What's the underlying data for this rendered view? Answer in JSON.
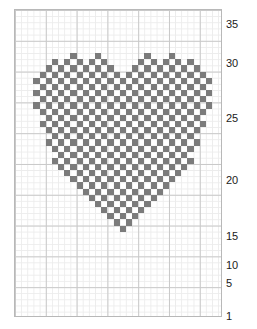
{
  "chart_data": {
    "type": "heatmap",
    "title": "",
    "subtitle": "",
    "xlabel": "",
    "ylabel": "",
    "grid": true,
    "legend_position": "none",
    "columns": 34,
    "rows": 50,
    "cell_size_px": 6.16,
    "major_gridline_every": 5,
    "axis_ranges": {
      "x": [
        1,
        34
      ],
      "y": [
        1,
        50
      ]
    },
    "colors": {
      "filled_cell": "#7b7b7b",
      "empty_cell": "#ffffff",
      "minor_gridline": "#ececec",
      "major_gridline": "#c9c9c9",
      "border": "#b8b8b8",
      "label_text": "#1a1a1a",
      "background": "#ffffff"
    },
    "y_tick_labels": [
      "35",
      "30",
      "25",
      "20",
      "15",
      "10",
      "5",
      "1"
    ],
    "y_tick_values": [
      35,
      30,
      25,
      20,
      15,
      10,
      5,
      1
    ],
    "y_tick_pixel_y": [
      24,
      63,
      118,
      180,
      236,
      265,
      283,
      316
    ],
    "pattern_note": "Row entries list the column indices (1-based, left to right) of filled squares for each chart row, top row first.",
    "filled_by_row": [
      {
        "row": 8,
        "cols": [
          10,
          14,
          22,
          26
        ]
      },
      {
        "row": 9,
        "cols": [
          7,
          9,
          11,
          13,
          15,
          21,
          23,
          25,
          27,
          29
        ]
      },
      {
        "row": 10,
        "cols": [
          6,
          8,
          10,
          12,
          14,
          16,
          20,
          22,
          24,
          26,
          28,
          30
        ]
      },
      {
        "row": 11,
        "cols": [
          5,
          7,
          9,
          11,
          13,
          15,
          17,
          19,
          21,
          23,
          25,
          27,
          29,
          31
        ]
      },
      {
        "row": 12,
        "cols": [
          4,
          6,
          8,
          10,
          12,
          14,
          16,
          18,
          20,
          22,
          24,
          26,
          28,
          30,
          32
        ]
      },
      {
        "row": 13,
        "cols": [
          5,
          7,
          9,
          11,
          13,
          15,
          17,
          19,
          21,
          23,
          25,
          27,
          29,
          31
        ]
      },
      {
        "row": 14,
        "cols": [
          4,
          6,
          8,
          10,
          12,
          14,
          16,
          18,
          20,
          22,
          24,
          26,
          28,
          30,
          32
        ]
      },
      {
        "row": 15,
        "cols": [
          5,
          7,
          9,
          11,
          13,
          15,
          17,
          19,
          21,
          23,
          25,
          27,
          29,
          31
        ]
      },
      {
        "row": 16,
        "cols": [
          4,
          6,
          8,
          10,
          12,
          14,
          16,
          18,
          20,
          22,
          24,
          26,
          28,
          30,
          32
        ]
      },
      {
        "row": 17,
        "cols": [
          5,
          7,
          9,
          11,
          13,
          15,
          17,
          19,
          21,
          23,
          25,
          27,
          29,
          31
        ]
      },
      {
        "row": 18,
        "cols": [
          6,
          8,
          10,
          12,
          14,
          16,
          18,
          20,
          22,
          24,
          26,
          28,
          30
        ]
      },
      {
        "row": 19,
        "cols": [
          5,
          7,
          9,
          11,
          13,
          15,
          17,
          19,
          21,
          23,
          25,
          27,
          29,
          31
        ]
      },
      {
        "row": 20,
        "cols": [
          6,
          8,
          10,
          12,
          14,
          16,
          18,
          20,
          22,
          24,
          26,
          28,
          30
        ]
      },
      {
        "row": 21,
        "cols": [
          7,
          9,
          11,
          13,
          15,
          17,
          19,
          21,
          23,
          25,
          27,
          29
        ]
      },
      {
        "row": 22,
        "cols": [
          6,
          8,
          10,
          12,
          14,
          16,
          18,
          20,
          22,
          24,
          26,
          28,
          30
        ]
      },
      {
        "row": 23,
        "cols": [
          7,
          9,
          11,
          13,
          15,
          17,
          19,
          21,
          23,
          25,
          27,
          29
        ]
      },
      {
        "row": 24,
        "cols": [
          8,
          10,
          12,
          14,
          16,
          18,
          20,
          22,
          24,
          26,
          28
        ]
      },
      {
        "row": 25,
        "cols": [
          7,
          9,
          11,
          13,
          15,
          17,
          19,
          21,
          23,
          25,
          27,
          29
        ]
      },
      {
        "row": 26,
        "cols": [
          8,
          10,
          12,
          14,
          16,
          18,
          20,
          22,
          24,
          26,
          28
        ]
      },
      {
        "row": 27,
        "cols": [
          9,
          11,
          13,
          15,
          17,
          19,
          21,
          23,
          25,
          27
        ]
      },
      {
        "row": 28,
        "cols": [
          10,
          12,
          14,
          16,
          18,
          20,
          22,
          24,
          26
        ]
      },
      {
        "row": 29,
        "cols": [
          11,
          13,
          15,
          17,
          19,
          21,
          23,
          25
        ]
      },
      {
        "row": 30,
        "cols": [
          12,
          14,
          16,
          18,
          20,
          22,
          24
        ]
      },
      {
        "row": 31,
        "cols": [
          13,
          15,
          17,
          19,
          21,
          23
        ]
      },
      {
        "row": 32,
        "cols": [
          14,
          16,
          18,
          20,
          22
        ]
      },
      {
        "row": 33,
        "cols": [
          15,
          17,
          19,
          21
        ]
      },
      {
        "row": 34,
        "cols": [
          16,
          18,
          20
        ]
      },
      {
        "row": 35,
        "cols": [
          17,
          19
        ]
      },
      {
        "row": 36,
        "cols": [
          18
        ]
      }
    ]
  }
}
